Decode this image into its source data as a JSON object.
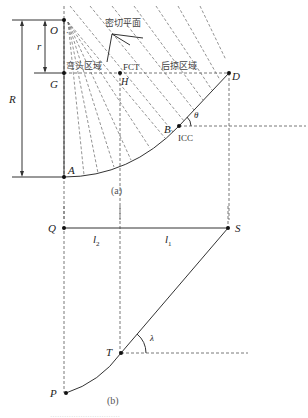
{
  "figure_a": {
    "caption": "(a)",
    "points": {
      "O": "O",
      "G": "G",
      "H": "H",
      "D": "D",
      "B": "B",
      "A": "A"
    },
    "dimensions": {
      "R": "R",
      "r": "r"
    },
    "angle": "θ",
    "labels": {
      "tangent_plane": "密切平面",
      "head_region": "弯头区域",
      "fct": "FCT",
      "tail_region": "后掠区域",
      "icc": "ICC"
    }
  },
  "figure_b": {
    "caption": "(b)",
    "points": {
      "Q": "Q",
      "S": "S",
      "T": "T",
      "P": "P"
    },
    "segments": {
      "l2": "l",
      "l2_sub": "2",
      "l1": "l",
      "l1_sub": "1"
    },
    "angle": "λ"
  },
  "footer": {
    "caption_faint": "…………………………"
  }
}
